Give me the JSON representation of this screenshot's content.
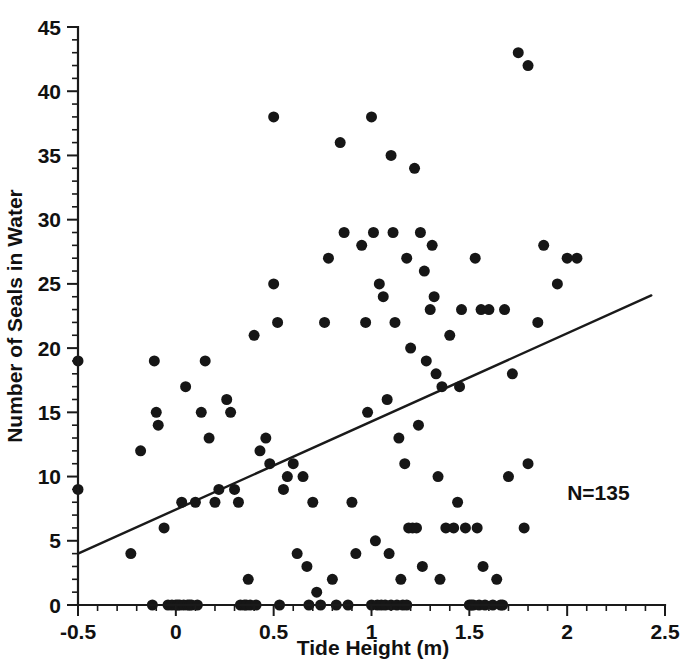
{
  "chart_data": {
    "type": "scatter",
    "title": "",
    "xlabel": "Tide Height (m)",
    "ylabel": "Number of Seals in Water",
    "xlim": [
      -0.5,
      2.5
    ],
    "ylim": [
      0,
      45
    ],
    "xticks": [
      -0.5,
      0,
      0.5,
      1,
      1.5,
      2,
      2.5
    ],
    "xticklabels": [
      "-0.5",
      "0",
      "0.5",
      "1",
      "1.5",
      "2",
      "2.5"
    ],
    "yticks": [
      0,
      5,
      10,
      15,
      20,
      25,
      30,
      35,
      40,
      45
    ],
    "yticklabels": [
      "0",
      "5",
      "10",
      "15",
      "20",
      "25",
      "30",
      "35",
      "40",
      "45"
    ],
    "x_minor_tick_interval": 0.1,
    "y_minor_tick_interval": 1,
    "grid": false,
    "legend": false,
    "marker": "filled-circle",
    "marker_color": "#161616",
    "marker_size_px": 11,
    "annotations": [
      {
        "text": "N=135",
        "x": 2.0,
        "y": 8.2
      }
    ],
    "trendline": {
      "type": "linear-regression",
      "color": "#1a1a1a",
      "x_start": -0.5,
      "y_start": 4.0,
      "x_end": 2.43,
      "y_end": 24.1,
      "slope": 6.86,
      "intercept": 7.43
    },
    "n_points_label": "N=135",
    "points": [
      [
        -0.5,
        19
      ],
      [
        -0.5,
        9
      ],
      [
        -0.23,
        4
      ],
      [
        -0.18,
        12
      ],
      [
        -0.12,
        0
      ],
      [
        -0.11,
        19
      ],
      [
        -0.1,
        15
      ],
      [
        -0.09,
        14
      ],
      [
        -0.06,
        6
      ],
      [
        -0.04,
        0
      ],
      [
        -0.02,
        0
      ],
      [
        0.0,
        0
      ],
      [
        0.01,
        0
      ],
      [
        0.02,
        0
      ],
      [
        0.03,
        8
      ],
      [
        0.04,
        0
      ],
      [
        0.05,
        17
      ],
      [
        0.06,
        0
      ],
      [
        0.07,
        0
      ],
      [
        0.08,
        0
      ],
      [
        0.1,
        8
      ],
      [
        0.11,
        0
      ],
      [
        0.13,
        15
      ],
      [
        0.15,
        19
      ],
      [
        0.17,
        13
      ],
      [
        0.2,
        8
      ],
      [
        0.22,
        9
      ],
      [
        0.26,
        16
      ],
      [
        0.28,
        15
      ],
      [
        0.3,
        9
      ],
      [
        0.32,
        8
      ],
      [
        0.33,
        0
      ],
      [
        0.35,
        0
      ],
      [
        0.36,
        0
      ],
      [
        0.37,
        2
      ],
      [
        0.38,
        0
      ],
      [
        0.4,
        21
      ],
      [
        0.41,
        0
      ],
      [
        0.43,
        12
      ],
      [
        0.46,
        13
      ],
      [
        0.48,
        11
      ],
      [
        0.5,
        25
      ],
      [
        0.5,
        38
      ],
      [
        0.52,
        22
      ],
      [
        0.53,
        0
      ],
      [
        0.55,
        9
      ],
      [
        0.57,
        10
      ],
      [
        0.6,
        11
      ],
      [
        0.62,
        4
      ],
      [
        0.65,
        10
      ],
      [
        0.67,
        3
      ],
      [
        0.68,
        0
      ],
      [
        0.7,
        8
      ],
      [
        0.72,
        1
      ],
      [
        0.74,
        0
      ],
      [
        0.76,
        22
      ],
      [
        0.78,
        27
      ],
      [
        0.8,
        2
      ],
      [
        0.82,
        0
      ],
      [
        0.84,
        36
      ],
      [
        0.86,
        29
      ],
      [
        0.88,
        0
      ],
      [
        0.9,
        8
      ],
      [
        0.92,
        4
      ],
      [
        0.95,
        28
      ],
      [
        0.97,
        22
      ],
      [
        0.98,
        15
      ],
      [
        1.0,
        38
      ],
      [
        1.0,
        0
      ],
      [
        1.01,
        29
      ],
      [
        1.02,
        5
      ],
      [
        1.03,
        0
      ],
      [
        1.04,
        25
      ],
      [
        1.05,
        0
      ],
      [
        1.06,
        24
      ],
      [
        1.07,
        0
      ],
      [
        1.08,
        16
      ],
      [
        1.09,
        4
      ],
      [
        1.1,
        35
      ],
      [
        1.1,
        0
      ],
      [
        1.11,
        29
      ],
      [
        1.12,
        22
      ],
      [
        1.13,
        0
      ],
      [
        1.14,
        13
      ],
      [
        1.15,
        2
      ],
      [
        1.16,
        0
      ],
      [
        1.17,
        11
      ],
      [
        1.18,
        0
      ],
      [
        1.18,
        27
      ],
      [
        1.19,
        6
      ],
      [
        1.2,
        20
      ],
      [
        1.21,
        6
      ],
      [
        1.22,
        34
      ],
      [
        1.23,
        6
      ],
      [
        1.24,
        14
      ],
      [
        1.25,
        29
      ],
      [
        1.26,
        3
      ],
      [
        1.27,
        26
      ],
      [
        1.28,
        19
      ],
      [
        1.3,
        23
      ],
      [
        1.31,
        28
      ],
      [
        1.32,
        24
      ],
      [
        1.33,
        18
      ],
      [
        1.34,
        10
      ],
      [
        1.35,
        2
      ],
      [
        1.36,
        17
      ],
      [
        1.38,
        6
      ],
      [
        1.4,
        21
      ],
      [
        1.42,
        6
      ],
      [
        1.44,
        8
      ],
      [
        1.45,
        17
      ],
      [
        1.46,
        23
      ],
      [
        1.48,
        6
      ],
      [
        1.5,
        0
      ],
      [
        1.51,
        0
      ],
      [
        1.52,
        0
      ],
      [
        1.53,
        27
      ],
      [
        1.54,
        6
      ],
      [
        1.55,
        0
      ],
      [
        1.56,
        23
      ],
      [
        1.57,
        3
      ],
      [
        1.58,
        0
      ],
      [
        1.6,
        23
      ],
      [
        1.62,
        0
      ],
      [
        1.64,
        2
      ],
      [
        1.66,
        0
      ],
      [
        1.67,
        0
      ],
      [
        1.68,
        23
      ],
      [
        1.7,
        10
      ],
      [
        1.72,
        18
      ],
      [
        1.75,
        43
      ],
      [
        1.78,
        6
      ],
      [
        1.8,
        42
      ],
      [
        1.8,
        11
      ],
      [
        1.85,
        22
      ],
      [
        1.88,
        28
      ],
      [
        1.95,
        25
      ],
      [
        2.0,
        27
      ],
      [
        2.05,
        27
      ]
    ]
  },
  "figure": {
    "background": "#ffffff",
    "foreground": "#1a1a1a"
  }
}
